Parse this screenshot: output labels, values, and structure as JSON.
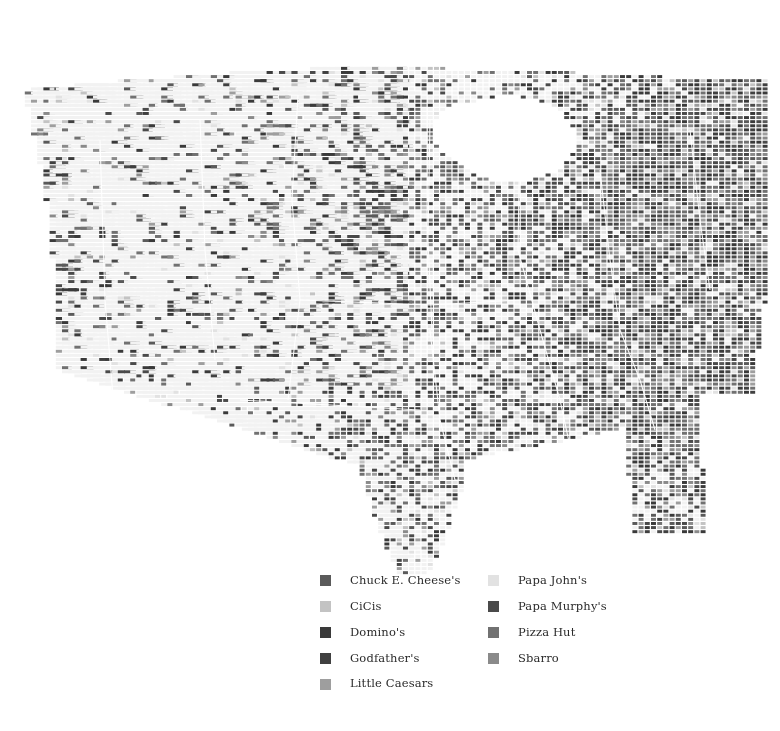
{
  "figure": {
    "type": "dot-density-choropleth-map",
    "region": "United States (contiguous 48 states)",
    "background_color": "#ffffff",
    "empty_cell_color": "#f2f2f2",
    "state_border_color": "#ffffff"
  },
  "legend": {
    "columns": [
      {
        "entries": [
          {
            "label": "Chuck E. Cheese's",
            "color": "#5a5a5a",
            "key": "chuck-e-cheeses"
          },
          {
            "label": "CiCis",
            "color": "#c3c3c3",
            "key": "cicis"
          },
          {
            "label": "Domino's",
            "color": "#3a3a3a",
            "key": "dominos"
          },
          {
            "label": "Godfather's",
            "color": "#404040",
            "key": "godfathers"
          },
          {
            "label": "Little Caesars",
            "color": "#9e9e9e",
            "key": "little-caesars"
          }
        ]
      },
      {
        "entries": [
          {
            "label": "Papa John's",
            "color": "#e2e2e2",
            "key": "papa-johns"
          },
          {
            "label": "Papa Murphy's",
            "color": "#4a4a4a",
            "key": "papa-murphys"
          },
          {
            "label": "Pizza Hut",
            "color": "#717171",
            "key": "pizza-hut"
          },
          {
            "label": "Sbarro",
            "color": "#8a8a8a",
            "key": "sbarro"
          }
        ]
      }
    ]
  },
  "chart_data": {
    "type": "heatmap",
    "title": "",
    "xlabel": "",
    "ylabel": "",
    "grid": {
      "cell_width": 6.2,
      "cell_height": 4.1,
      "cols": 126,
      "rows": 140,
      "origin_x": 0,
      "origin_y": 30
    },
    "categories": [
      "Chuck E. Cheese's",
      "CiCis",
      "Domino's",
      "Godfather's",
      "Little Caesars",
      "Papa John's",
      "Papa Murphy's",
      "Pizza Hut",
      "Sbarro"
    ],
    "colors": [
      "#5a5a5a",
      "#c3c3c3",
      "#3a3a3a",
      "#404040",
      "#9e9e9e",
      "#e2e2e2",
      "#4a4a4a",
      "#717171",
      "#8a8a8a"
    ],
    "series": [
      {
        "name": "Chuck E. Cheese's",
        "weight": 0.1
      },
      {
        "name": "CiCis",
        "weight": 0.06
      },
      {
        "name": "Domino's",
        "weight": 0.16
      },
      {
        "name": "Godfather's",
        "weight": 0.07
      },
      {
        "name": "Little Caesars",
        "weight": 0.12
      },
      {
        "name": "Papa John's",
        "weight": 0.07
      },
      {
        "name": "Papa Murphy's",
        "weight": 0.12
      },
      {
        "name": "Pizza Hut",
        "weight": 0.22
      },
      {
        "name": "Sbarro",
        "weight": 0.08
      }
    ],
    "legend_position": "bottom-center",
    "grid_on": false
  }
}
